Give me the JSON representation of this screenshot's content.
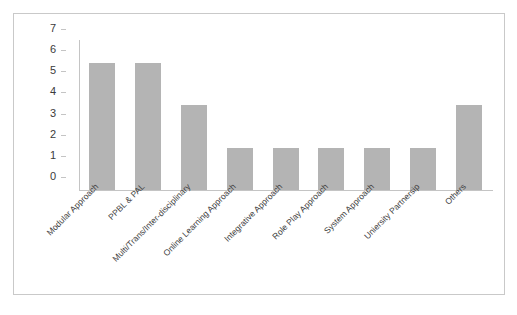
{
  "chart_data": {
    "type": "bar",
    "title": "",
    "subtitle": "",
    "xlabel": "",
    "ylabel": "",
    "ylim": [
      0,
      7
    ],
    "yticks": [
      0,
      1,
      2,
      3,
      4,
      5,
      6,
      7
    ],
    "ytick_labels": [
      "0",
      "1",
      "2",
      "3",
      "4",
      "5",
      "6",
      "7"
    ],
    "grid": false,
    "legend": false,
    "legend_position": "none",
    "bar_color": "#b4b4b4",
    "axis_color": "#c4c4c4",
    "frame_color": "#c9c9c9",
    "categories": [
      "Modular Approach",
      "PPBL & PAL",
      "Multi/Trans/Inter-disciplinary",
      "Online Learning Approach",
      "Integrative Approach",
      "Role Play Approach",
      "System Approach",
      "Uniersity Partnersip",
      "Others"
    ],
    "values": [
      6,
      6,
      4,
      2,
      2,
      2,
      2,
      2,
      4
    ]
  }
}
